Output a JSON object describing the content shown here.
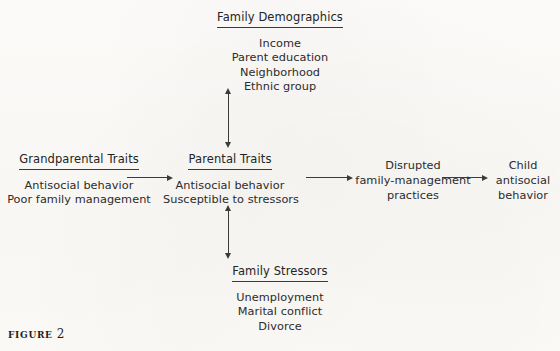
{
  "figure": {
    "caption_label": "FIGURE",
    "caption_number": "2"
  },
  "nodes": {
    "family_demographics": {
      "heading": "Family Demographics",
      "items": [
        "Income",
        "Parent education",
        "Neighborhood",
        "Ethnic group"
      ]
    },
    "grandparental_traits": {
      "heading": "Grandparental Traits",
      "items": [
        "Antisocial behavior",
        "Poor family management"
      ]
    },
    "parental_traits": {
      "heading": "Parental Traits",
      "items": [
        "Antisocial behavior",
        "Susceptible to stressors"
      ]
    },
    "disrupted_practices": {
      "heading": "",
      "items": [
        "Disrupted",
        "family-management",
        "practices"
      ]
    },
    "child_outcome": {
      "heading": "",
      "items": [
        "Child",
        "antisocial",
        "behavior"
      ]
    },
    "family_stressors": {
      "heading": "Family Stressors",
      "items": [
        "Unemployment",
        "Marital conflict",
        "Divorce"
      ]
    }
  },
  "edges": {
    "grandparental_to_parental": "arrow-right",
    "parental_to_disrupted": "arrow-right",
    "disrupted_to_child": "arrow-right",
    "demographics_parental": "arrow-double-vertical",
    "parental_stressors": "arrow-double-vertical"
  },
  "colors": {
    "ink": "#2a2a2a",
    "rule": "#3a3a3a",
    "paper": "#fdfdfb"
  }
}
